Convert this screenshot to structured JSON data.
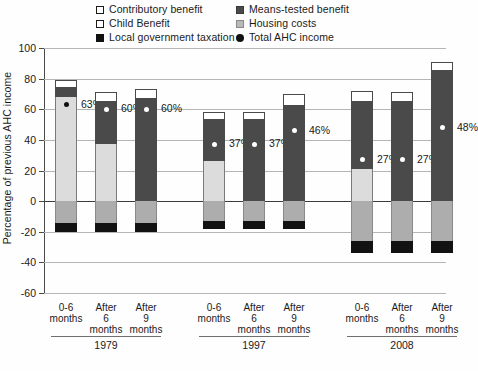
{
  "legend": {
    "columns": [
      [
        {
          "label": "Contributory benefit",
          "marker": "square-white-outline",
          "key": "contributory"
        },
        {
          "label": "Child Benefit",
          "marker": "square-white-outline",
          "key": "child"
        },
        {
          "label": "Local government taxation",
          "marker": "square-black",
          "key": "localtax"
        }
      ],
      [
        {
          "label": "Means-tested benefit",
          "marker": "square-dark-gray",
          "key": "means"
        },
        {
          "label": "Housing costs",
          "marker": "square-light-gray",
          "key": "housing"
        },
        {
          "label": "Total AHC income",
          "marker": "dot-black",
          "key": "total"
        }
      ]
    ]
  },
  "axis": {
    "y_title": "Percentage of previous AHC income",
    "y_ticks": [
      "100",
      "80",
      "60",
      "40",
      "20",
      "0",
      "-20",
      "-40",
      "-60"
    ]
  },
  "groups": [
    {
      "name": "1979",
      "bars": [
        {
          "label_lines": [
            "0-6",
            "months"
          ],
          "data_label": "63%"
        },
        {
          "label_lines": [
            "After",
            "6",
            "months"
          ],
          "data_label": "60%"
        },
        {
          "label_lines": [
            "After",
            "9",
            "months"
          ],
          "data_label": "60%"
        }
      ]
    },
    {
      "name": "1997",
      "bars": [
        {
          "label_lines": [
            "0-6",
            "months"
          ],
          "data_label": "37%"
        },
        {
          "label_lines": [
            "After",
            "6",
            "months"
          ],
          "data_label": "37%"
        },
        {
          "label_lines": [
            "After",
            "9",
            "months"
          ],
          "data_label": "46%"
        }
      ]
    },
    {
      "name": "2008",
      "bars": [
        {
          "label_lines": [
            "0-6",
            "months"
          ],
          "data_label": "27%"
        },
        {
          "label_lines": [
            "After",
            "6",
            "months"
          ],
          "data_label": "27%"
        },
        {
          "label_lines": [
            "After",
            "9",
            "months"
          ],
          "data_label": "48%"
        }
      ]
    }
  ],
  "colors": {
    "contributory": "#ffffff",
    "child": "#dcdcdc",
    "means": "#4a4a4a",
    "housing": "#adadad",
    "localtax": "#121212",
    "gridline": "#b5b5b5",
    "axis": "#4a4a4a"
  },
  "chart_data": {
    "type": "bar",
    "title": "",
    "subtitle": "",
    "xlabel": "",
    "ylabel": "Percentage of previous AHC income",
    "ylim": [
      -60,
      100
    ],
    "ytick_step": 20,
    "grid": true,
    "stacked": true,
    "legend_position": "top",
    "categories": [
      "1979 0-6 months",
      "1979 After 6 months",
      "1979 After 9 months",
      "1997 0-6 months",
      "1997 After 6 months",
      "1997 After 9 months",
      "2008 0-6 months",
      "2008 After 6 months",
      "2008 After 9 months"
    ],
    "group_labels": [
      "1979",
      "1997",
      "2008"
    ],
    "bar_labels": [
      "0-6 months",
      "After 6 months",
      "After 9 months"
    ],
    "series": [
      {
        "name": "Child Benefit",
        "color": "#dcdcdc",
        "values": [
          68,
          37,
          0,
          26,
          0,
          0,
          21,
          0,
          0
        ]
      },
      {
        "name": "Means-tested benefit",
        "color": "#4a4a4a",
        "values": [
          6,
          28,
          67,
          27,
          53,
          62,
          44,
          65,
          85
        ]
      },
      {
        "name": "Contributory benefit",
        "color": "#ffffff",
        "values": [
          5,
          6,
          6,
          5,
          5,
          8,
          7,
          6,
          6
        ]
      },
      {
        "name": "Housing costs",
        "color": "#adadad",
        "values": [
          -14,
          -14,
          -14,
          -13,
          -13,
          -13,
          -26,
          -26,
          -26
        ]
      },
      {
        "name": "Local government taxation",
        "color": "#121212",
        "values": [
          -6,
          -6,
          -6,
          -5,
          -5,
          -5,
          -8,
          -8,
          -8
        ]
      }
    ],
    "bar_totals_top": [
      79,
      71,
      73,
      58,
      58,
      70,
      72,
      71,
      91
    ],
    "bar_totals_bottom": [
      -20,
      -20,
      -20,
      -18,
      -18,
      -18,
      -34,
      -34,
      -34
    ],
    "markers": {
      "name": "Total AHC income",
      "values": [
        63,
        60,
        60,
        37,
        37,
        46,
        27,
        27,
        48
      ],
      "labels": [
        "63%",
        "60%",
        "60%",
        "37%",
        "37%",
        "46%",
        "27%",
        "27%",
        "48%"
      ]
    }
  }
}
